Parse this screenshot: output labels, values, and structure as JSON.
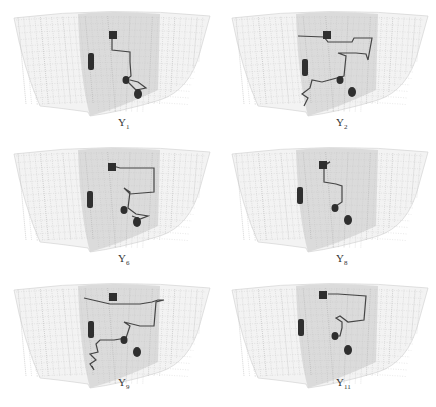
{
  "figure": {
    "panels": [
      {
        "id": "p1",
        "label": "Y",
        "subscript": "1",
        "x": 0,
        "y": 0,
        "path": "M112,34 L112,50 L130,52 L130,62 L131,76 L126,80 L136,90 L146,88 L138,82 L130,80",
        "square": [
          112,
          34
        ],
        "bar": [
          91,
          62
        ],
        "dot1": [
          126,
          80
        ],
        "dot2": [
          138,
          94
        ]
      },
      {
        "id": "p2",
        "label": "Y",
        "subscript": "2",
        "x": 218,
        "y": 0,
        "path": "M80,36 L106,37 L110,42 L134,42 L136,38 L154,38 L150,60 L148,54 L138,53 L120,53 L128,56 L126,76 L104,82 L94,80 L92,88 L84,94 L90,98 L86,106",
        "square": [
          108,
          34
        ],
        "bar": [
          87,
          68
        ],
        "dot1": [
          122,
          80
        ],
        "dot2": [
          134,
          92
        ]
      },
      {
        "id": "p6",
        "label": "Y",
        "subscript": "6",
        "x": 0,
        "y": 136,
        "path": "M113,30 L120,32 L154,32 L154,56 L130,58 L124,52 L130,56 L128,72 L136,78 L148,80 L140,83 L132,80",
        "square": [
          111,
          30
        ],
        "bar": [
          90,
          64
        ],
        "dot1": [
          124,
          74
        ],
        "dot2": [
          137,
          86
        ]
      },
      {
        "id": "p8",
        "label": "Y",
        "subscript": "8",
        "x": 218,
        "y": 136,
        "path": "M106,28 L112,26 L106,30 L106,46 L118,48 L124,50 L124,66 L118,70",
        "square": [
          104,
          28
        ],
        "bar": [
          82,
          60
        ],
        "dot1": [
          117,
          72
        ],
        "dot2": [
          130,
          84
        ]
      },
      {
        "id": "p9",
        "label": "Y",
        "subscript": "9",
        "x": 0,
        "y": 272,
        "path": "M84,26 L110,32 L140,32 L152,30 L158,28 L164,28 L156,30 L154,54 L140,54 L124,50 L130,54 L126,66 L114,68 L100,68 L96,72 L98,80 L90,82 L96,88 L90,92 L94,98 L92,94",
        "square": [
          112,
          24
        ],
        "bar": [
          91,
          58
        ],
        "dot1": [
          124,
          68
        ],
        "dot2": [
          137,
          80
        ]
      },
      {
        "id": "p11",
        "label": "Y",
        "subscript": "11",
        "x": 218,
        "y": 272,
        "path": "M110,22 L120,22 L148,24 L146,48 L130,50 L122,44 L118,46 L124,50 L124,56 L122,64 L120,64",
        "square": [
          104,
          22
        ],
        "bar": [
          83,
          56
        ],
        "dot1": [
          117,
          64
        ],
        "dot2": [
          130,
          78
        ]
      }
    ]
  }
}
